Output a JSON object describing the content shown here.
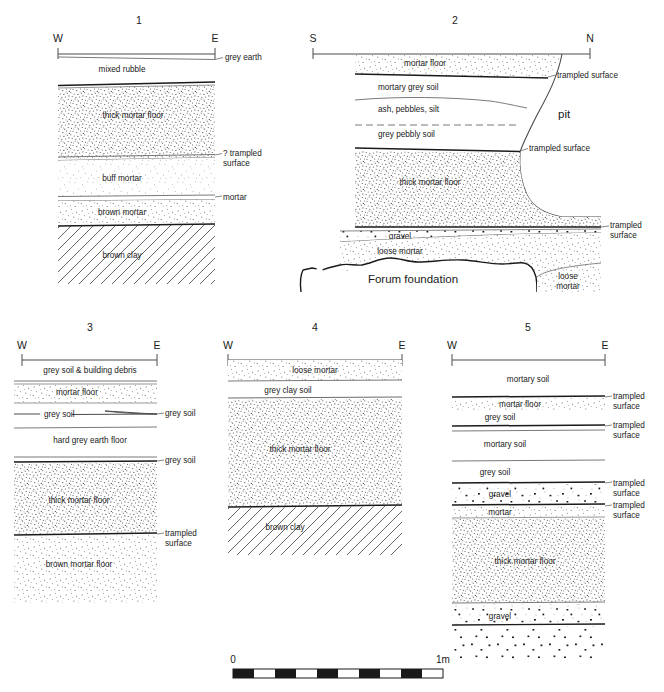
{
  "figure": {
    "type": "archaeological-section-drawing",
    "scale_bar": {
      "left_label": "0",
      "right_label": "1m",
      "segments": 10
    }
  },
  "sections": [
    {
      "number": "1",
      "left_orientation": "W",
      "right_orientation": "E",
      "layers": [
        {
          "label": "grey earth",
          "kind": "leader-right"
        },
        {
          "label": "mixed rubble",
          "kind": "inside"
        },
        {
          "label": "thick mortar floor",
          "kind": "inside"
        },
        {
          "label": "? trampled\nsurface",
          "kind": "leader-right"
        },
        {
          "label": "buff mortar",
          "kind": "inside"
        },
        {
          "label": "mortar",
          "kind": "leader-right"
        },
        {
          "label": "brown mortar",
          "kind": "inside"
        },
        {
          "label": "brown clay",
          "kind": "inside"
        }
      ]
    },
    {
      "number": "2",
      "left_orientation": "S",
      "right_orientation": "N",
      "layers": [
        {
          "label": "mortar floor",
          "kind": "inside"
        },
        {
          "label": "trampled surface",
          "kind": "leader-right"
        },
        {
          "label": "mortary grey soil",
          "kind": "inside"
        },
        {
          "label": "ash, pebbles, silt",
          "kind": "inside"
        },
        {
          "label": "grey pebbly soil",
          "kind": "inside"
        },
        {
          "label": "pit",
          "kind": "inside"
        },
        {
          "label": "trampled surface",
          "kind": "leader-right"
        },
        {
          "label": "thick mortar floor",
          "kind": "inside"
        },
        {
          "label": "trampled\nsurface",
          "kind": "leader-right"
        },
        {
          "label": "gravel",
          "kind": "inside"
        },
        {
          "label": "loose mortar",
          "kind": "inside"
        },
        {
          "label": "Forum foundation",
          "kind": "inside"
        },
        {
          "label": "loose\nmortar",
          "kind": "inside"
        }
      ]
    },
    {
      "number": "3",
      "left_orientation": "W",
      "right_orientation": "E",
      "layers": [
        {
          "label": "grey soil & building debris",
          "kind": "inside"
        },
        {
          "label": "mortar floor",
          "kind": "inside"
        },
        {
          "label": "grey soil",
          "kind": "inside"
        },
        {
          "label": "grey soil",
          "kind": "leader-right"
        },
        {
          "label": "hard grey earth floor",
          "kind": "inside"
        },
        {
          "label": "grey soil",
          "kind": "leader-right"
        },
        {
          "label": "thick mortar floor",
          "kind": "inside"
        },
        {
          "label": "trampled\nsurface",
          "kind": "leader-right"
        },
        {
          "label": "brown mortar floor",
          "kind": "inside"
        }
      ]
    },
    {
      "number": "4",
      "left_orientation": "W",
      "right_orientation": "E",
      "layers": [
        {
          "label": "loose mortar",
          "kind": "inside"
        },
        {
          "label": "grey clay soil",
          "kind": "inside"
        },
        {
          "label": "thick mortar floor",
          "kind": "inside"
        },
        {
          "label": "brown clay",
          "kind": "inside"
        }
      ]
    },
    {
      "number": "5",
      "left_orientation": "W",
      "right_orientation": "E",
      "layers": [
        {
          "label": "mortary soil",
          "kind": "inside"
        },
        {
          "label": "mortar floor",
          "kind": "inside"
        },
        {
          "label": "trampled\nsurface",
          "kind": "leader-right"
        },
        {
          "label": "grey soil",
          "kind": "inside"
        },
        {
          "label": "trampled\nsurface",
          "kind": "leader-right"
        },
        {
          "label": "mortary soil",
          "kind": "inside"
        },
        {
          "label": "grey soil",
          "kind": "inside"
        },
        {
          "label": "trampled\nsurface",
          "kind": "leader-right"
        },
        {
          "label": "gravel",
          "kind": "inside"
        },
        {
          "label": "mortar",
          "kind": "inside"
        },
        {
          "label": "trampled\nsurface",
          "kind": "leader-right"
        },
        {
          "label": "thick mortar floor",
          "kind": "inside"
        },
        {
          "label": "gravel",
          "kind": "inside"
        }
      ]
    }
  ],
  "s1": {
    "num": "1",
    "W": "W",
    "E": "E",
    "grey_earth": "grey earth",
    "mixed_rubble": "mixed rubble",
    "thick_mortar_floor": "thick mortar floor",
    "q_trampled": "? trampled",
    "surface": "surface",
    "buff_mortar": "buff mortar",
    "mortar": "mortar",
    "brown_mortar": "brown mortar",
    "brown_clay": "brown clay"
  },
  "s2": {
    "num": "2",
    "S": "S",
    "N": "N",
    "mortar_floor": "mortar floor",
    "trampled_surface_1": "trampled surface",
    "mortary_grey_soil": "mortary grey soil",
    "ash_pebbles_silt": "ash, pebbles, silt",
    "grey_pebbly_soil": "grey pebbly soil",
    "pit": "pit",
    "trampled_surface_2": "trampled surface",
    "thick_mortar_floor": "thick mortar floor",
    "trampled": "trampled",
    "surface": "surface",
    "gravel": "gravel",
    "loose_mortar": "loose mortar",
    "forum_foundation": "Forum foundation",
    "loose": "loose",
    "mortar2": "mortar"
  },
  "s3": {
    "num": "3",
    "W": "W",
    "E": "E",
    "grey_soil_debris": "grey soil & building debris",
    "mortar_floor": "mortar floor",
    "grey_soil_in": "grey soil",
    "grey_soil_right1": "grey soil",
    "hard_grey_earth_floor": "hard grey earth floor",
    "grey_soil_right2": "grey soil",
    "thick_mortar_floor": "thick mortar floor",
    "trampled": "trampled",
    "surface": "surface",
    "brown_mortar_floor": "brown mortar floor"
  },
  "s4": {
    "num": "4",
    "W": "W",
    "E": "E",
    "loose_mortar": "loose mortar",
    "grey_clay_soil": "grey clay soil",
    "thick_mortar_floor": "thick mortar floor",
    "brown_clay": "brown clay"
  },
  "s5": {
    "num": "5",
    "W": "W",
    "E": "E",
    "mortary_soil_1": "mortary soil",
    "mortar_floor": "mortar floor",
    "t1a": "trampled",
    "t1b": "surface",
    "grey_soil_1": "grey soil",
    "t2a": "trampled",
    "t2b": "surface",
    "mortary_soil_2": "mortary soil",
    "grey_soil_2": "grey soil",
    "t3a": "trampled",
    "t3b": "surface",
    "gravel_1": "gravel",
    "mortar": "mortar",
    "t4a": "trampled",
    "t4b": "surface",
    "thick_mortar_floor": "thick mortar floor",
    "gravel_2": "gravel"
  },
  "scale": {
    "zero": "0",
    "one_m": "1m"
  },
  "colors": {
    "ink": "#1a1a1a",
    "thin_line": "#6a6a6a",
    "stipple": "#3a3a3a",
    "paper": "#ffffff"
  }
}
